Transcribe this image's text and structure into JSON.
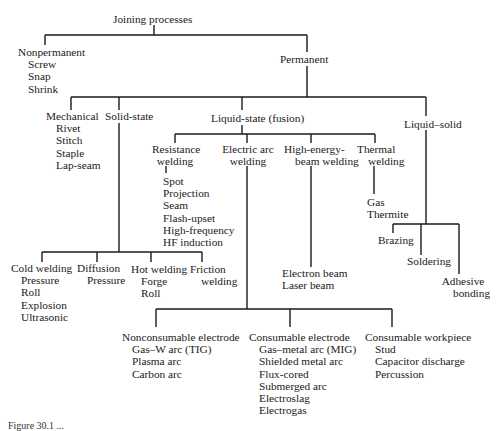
{
  "diagram": {
    "title": "Joining processes",
    "nodes": {
      "root": {
        "label": "Joining processes"
      },
      "nonpermanent": {
        "label": "Nonpermanent",
        "items": [
          "Screw",
          "Snap",
          "Shrink"
        ]
      },
      "permanent": {
        "label": "Permanent"
      },
      "mechanical": {
        "label": "Mechanical",
        "items": [
          "Rivet",
          "Stitch",
          "Staple",
          "Lap-seam"
        ]
      },
      "solid_state": {
        "label": "Solid-state"
      },
      "liquid_state": {
        "label": "Liquid-state (fusion)"
      },
      "liquid_solid": {
        "label": "Liquid–solid"
      },
      "resistance": {
        "label_1": "Resistance",
        "label_2": "welding",
        "items": [
          "Spot",
          "Projection",
          "Seam",
          "Flash-upset",
          "High-frequency",
          "HF induction"
        ]
      },
      "electric_arc": {
        "label_1": "Electric arc",
        "label_2": "welding"
      },
      "high_energy": {
        "label_1": "High-energy-",
        "label_2": "beam welding",
        "items": [
          "Electron beam",
          "Laser beam"
        ]
      },
      "thermal": {
        "label_1": "Thermal",
        "label_2": "welding",
        "items": [
          "Gas",
          "Thermite"
        ]
      },
      "brazing": {
        "label": "Brazing"
      },
      "soldering": {
        "label": "Soldering"
      },
      "adhesive": {
        "label_1": "Adhesive",
        "label_2": "bonding"
      },
      "cold_welding": {
        "label": "Cold welding",
        "items": [
          "Pressure",
          "Roll",
          "Explosion",
          "Ultrasonic"
        ]
      },
      "diffusion": {
        "label": "Diffusion",
        "items": [
          "Pressure"
        ]
      },
      "hot_welding": {
        "label": "Hot welding",
        "items": [
          "Forge",
          "Roll"
        ]
      },
      "friction": {
        "label_1": "Friction",
        "label_2": "welding"
      },
      "nonconsumable": {
        "label": "Nonconsumable electrode",
        "items": [
          "Gas–W arc (TIG)",
          "Plasma arc",
          "Carbon arc"
        ]
      },
      "consumable_electrode": {
        "label": "Consumable electrode",
        "items": [
          "Gas–metal arc (MIG)",
          "Shielded metal arc",
          "Flux-cored",
          "Submerged arc",
          "Electroslag",
          "Electrogas"
        ]
      },
      "consumable_workpiece": {
        "label": "Consumable workpiece",
        "items": [
          "Stud",
          "Capacitor discharge",
          "Percussion"
        ]
      }
    },
    "caption": "Figure 30.1 ..."
  }
}
